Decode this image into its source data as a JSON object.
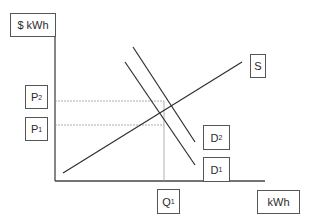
{
  "diagram": {
    "type": "supply-demand-shift",
    "y_axis_label": "$ kWh",
    "x_axis_label": "kWh",
    "labels": {
      "supply": "S",
      "demand_1": {
        "base": "D",
        "sub": "1"
      },
      "demand_2": {
        "base": "D",
        "sub": "2"
      },
      "price_1": {
        "base": "P",
        "sub": "1"
      },
      "price_2": {
        "base": "P",
        "sub": "2"
      },
      "quantity_1": {
        "base": "Q",
        "sub": "1"
      }
    },
    "colors": {
      "line": "#2f2f2f",
      "guide": "#9a9a9a",
      "box_border": "#555555"
    }
  }
}
